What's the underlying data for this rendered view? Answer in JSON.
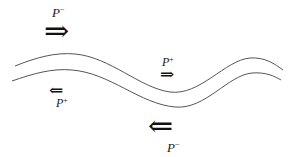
{
  "diagram": {
    "title": "",
    "curves": [
      {
        "name": "upper-wall",
        "color": "#555555"
      },
      {
        "name": "lower-wall",
        "color": "#555555"
      }
    ],
    "labels": [
      {
        "id": "top-left",
        "base": "P",
        "sup": "−",
        "arrow": "⇒",
        "direction": "right",
        "size": "large"
      },
      {
        "id": "middle-right",
        "base": "P",
        "sup": "+",
        "arrow": "⇒",
        "direction": "right",
        "size": "small"
      },
      {
        "id": "middle-left",
        "base": "P",
        "sup": "+",
        "arrow": "⇐",
        "direction": "left",
        "size": "small"
      },
      {
        "id": "bottom-right",
        "base": "P",
        "sup": "−",
        "arrow": "⇐",
        "direction": "left",
        "size": "large"
      }
    ]
  }
}
